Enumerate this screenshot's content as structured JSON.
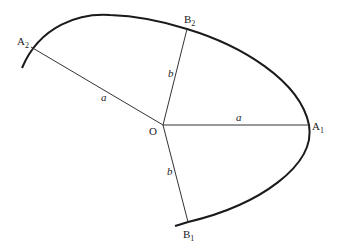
{
  "diagram": {
    "type": "geometric-curve",
    "colors": {
      "curve": "#1a1a1a",
      "line": "#333333",
      "text": "#1a1a1a"
    },
    "points": {
      "O": {
        "label": "O",
        "sub": "",
        "x": 163,
        "y": 125
      },
      "A1": {
        "label": "A",
        "sub": "1",
        "x": 309,
        "y": 125
      },
      "A2": {
        "label": "A",
        "sub": "2",
        "x": 31,
        "y": 47
      },
      "B1": {
        "label": "B",
        "sub": "1",
        "x": 188,
        "y": 222
      },
      "B2": {
        "label": "B",
        "sub": "2",
        "x": 187,
        "y": 29
      }
    },
    "segments": [
      {
        "from": "O",
        "to": "A1",
        "label": "a"
      },
      {
        "from": "O",
        "to": "A2",
        "label": "a"
      },
      {
        "from": "O",
        "to": "B1",
        "label": "b"
      },
      {
        "from": "O",
        "to": "B2",
        "label": "b"
      }
    ]
  }
}
